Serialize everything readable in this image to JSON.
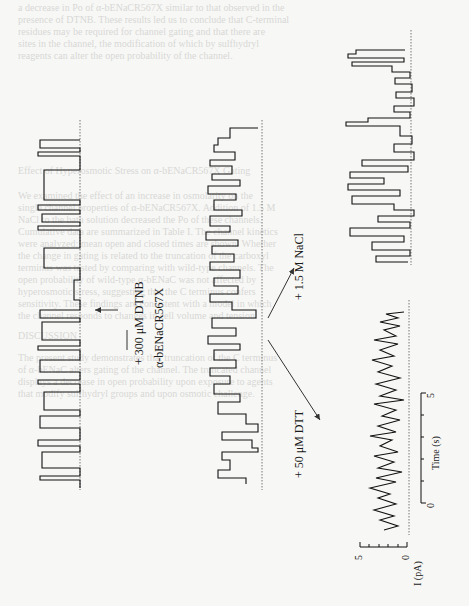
{
  "figure": {
    "orientation": "rotated 90° counter-clockwise on page",
    "construct_label": "α-bENaCR567X",
    "treatments": [
      {
        "id": "dtnb",
        "label": "+ 300 μM DTNB"
      },
      {
        "id": "dtt",
        "label": "+ 50 μM DTT"
      },
      {
        "id": "nacl",
        "label": "+ 1.5 M NaCl"
      }
    ],
    "scale_bar": {
      "current": {
        "label": "I (pA)",
        "min": "0",
        "max": "5"
      },
      "time": {
        "label": "Time (s)",
        "min": "0",
        "max": "5"
      }
    }
  },
  "bleed_text": [
    "a decrease in Po of α-bENaCR567X similar to that observed in the",
    "presence of DTNB. These results led us to conclude that C-terminal",
    "residues may be required for channel gating and that there are",
    "sites in the channel, the modification of which by sulfhydryl",
    "reagents can alter the open probability of the channel.",
    "",
    "Effect of Hyperosmotic Stress on α-bENaCR567X Gating",
    "",
    "We examined the effect of an increase in osmolarity on the",
    "single channel properties of α-bENaCR567X. Addition of 1.5 M",
    "NaCl to the bath solution decreased the Po of these channels.",
    "Cumulative data are summarized in Table I. The channel kinetics",
    "were analyzed; mean open and closed times are shown. Whether",
    "the change in gating is related to the truncation of the carboxyl",
    "terminus was tested by comparing with wild-type channels. The",
    "open probability of wild-type α-bENaC was not affected by",
    "hyperosmotic stress, suggesting that the C terminus confers",
    "sensitivity. These findings are consistent with a model in which",
    "the channel responds to changes in cell volume and tension.",
    "",
    "DISCUSSION",
    "",
    "The present study demonstrates that truncation of the C terminus",
    "of α-bENaC alters gating of the channel. The truncated channel",
    "displays a decrease in open probability upon exposure to agents",
    "that modify sulfhydryl groups and upon osmotic challenge."
  ]
}
